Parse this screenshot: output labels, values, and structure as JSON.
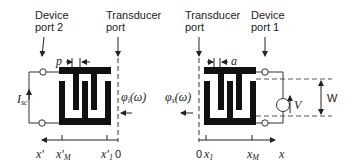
{
  "left_panel": {
    "device_port_label_line1": "Device",
    "device_port_label_line2": "port 2",
    "transducer_port_label_line1": "Transducer",
    "transducer_port_label_line2": "port",
    "period_label": "p",
    "wave_label": "φ",
    "wave_label_sub": "i",
    "wave_label_arg": "(ω)",
    "current_label": "I",
    "current_label_sub": "sc",
    "axis": {
      "name": "x'",
      "ticks": [
        {
          "label": "x'",
          "sub": "M"
        },
        {
          "label": "x'",
          "sub": "1"
        },
        {
          "label": "0",
          "sub": ""
        }
      ]
    }
  },
  "right_panel": {
    "transducer_port_label_line1": "Transducer",
    "transducer_port_label_line2": "port",
    "device_port_label_line1": "Device",
    "device_port_label_line2": "port 1",
    "spacing_label": "a",
    "wave_label": "φ",
    "wave_label_sub": "s",
    "wave_label_arg": "(ω)",
    "voltage_label": "V",
    "aperture_label": "W",
    "axis": {
      "name": "x",
      "ticks": [
        {
          "label": "0",
          "sub": ""
        },
        {
          "label": "x",
          "sub": "1"
        },
        {
          "label": "x",
          "sub": "M"
        }
      ]
    }
  },
  "colors": {
    "ink": "#111111",
    "line": "#333333",
    "dash": "#555555"
  }
}
